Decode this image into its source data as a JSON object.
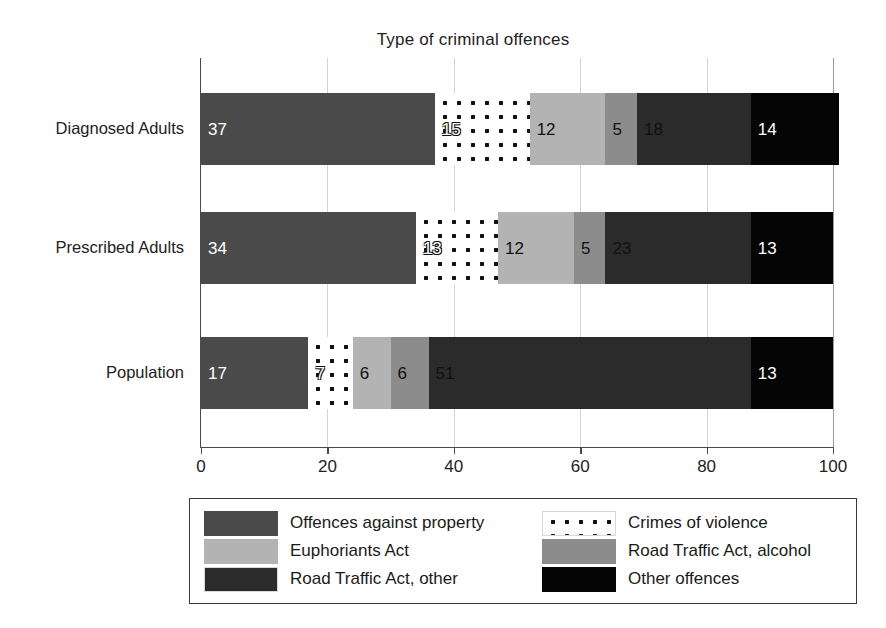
{
  "chart_data": {
    "type": "bar",
    "orientation": "horizontal",
    "stacked": true,
    "title": "Type of criminal offences",
    "xlabel": "",
    "ylabel": "",
    "xlim": [
      0,
      100
    ],
    "xticks": [
      0,
      20,
      40,
      60,
      80,
      100
    ],
    "grid": true,
    "legend_position": "bottom",
    "categories": [
      "Diagnosed Adults",
      "Prescribed Adults",
      "Population"
    ],
    "series": [
      {
        "name": "Offences against property",
        "key": "property",
        "pattern": "solid-dark-grey",
        "color": "#4a4a4a",
        "values": [
          37,
          34,
          17
        ]
      },
      {
        "name": "Crimes of violence",
        "key": "violence",
        "pattern": "dots",
        "color": "#ffffff",
        "values": [
          15,
          13,
          7
        ]
      },
      {
        "name": "Euphoriants Act",
        "key": "euphoriants",
        "pattern": "solid-light-grey",
        "color": "#b3b3b3",
        "values": [
          12,
          12,
          6
        ]
      },
      {
        "name": "Road Traffic Act, alcohol",
        "key": "alcohol",
        "pattern": "solid-mid-grey",
        "color": "#8c8c8c",
        "values": [
          5,
          5,
          6
        ]
      },
      {
        "name": "Road Traffic Act, other",
        "key": "road_other",
        "pattern": "dashes",
        "color": "#ffffff",
        "values": [
          18,
          23,
          51
        ]
      },
      {
        "name": "Other offences",
        "key": "other",
        "pattern": "solid-black",
        "color": "#050505",
        "values": [
          14,
          13,
          13
        ]
      }
    ]
  },
  "legend": {
    "items": [
      {
        "label": "Offences against property",
        "swatch": "property"
      },
      {
        "label": "Crimes of violence",
        "swatch": "violence"
      },
      {
        "label": "Euphoriants Act",
        "swatch": "euphoriants"
      },
      {
        "label": "Road Traffic Act, alcohol",
        "swatch": "alcohol"
      },
      {
        "label": "Road Traffic Act, other",
        "swatch": "road_other"
      },
      {
        "label": "Other offences",
        "swatch": "other"
      }
    ]
  }
}
